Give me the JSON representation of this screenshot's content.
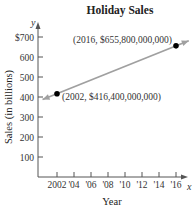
{
  "chart_data": {
    "type": "line",
    "title": "Holiday Sales",
    "xlabel": "Year",
    "ylabel": "Sales (in billions)",
    "x_axis_letter": "x",
    "y_axis_letter": "y",
    "x_ticks": [
      2002,
      2004,
      2006,
      2008,
      2010,
      2012,
      2014,
      2016
    ],
    "x_tick_labels": [
      "2002",
      "'04",
      "'06",
      "'08",
      "'10",
      "'12",
      "'14",
      "'16"
    ],
    "y_ticks": [
      100,
      200,
      300,
      400,
      500,
      600,
      700
    ],
    "y_tick_labels": [
      "100",
      "200",
      "300",
      "400",
      "500",
      "600",
      "$700"
    ],
    "xlim": [
      2000,
      2017.5
    ],
    "ylim": [
      0,
      740
    ],
    "grid": false,
    "series": [
      {
        "name": "Holiday Sales trend",
        "color": "#a0a0a0",
        "x": [
          2002,
          2016
        ],
        "y": [
          416.4,
          655.8
        ],
        "extends_both_directions": true
      }
    ],
    "points": [
      {
        "x": 2002,
        "y": 416.4,
        "label": "(2002, $416,400,000,000)",
        "color": "#000000"
      },
      {
        "x": 2016,
        "y": 655.8,
        "label": "(2016, $655,800,000,000)",
        "color": "#000000"
      }
    ]
  }
}
